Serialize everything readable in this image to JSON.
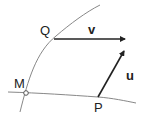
{
  "diagram": {
    "points": {
      "M": {
        "label": "M"
      },
      "Q": {
        "label": "Q"
      },
      "P": {
        "label": "P"
      }
    },
    "vectors": {
      "v": {
        "label": "v",
        "from": "Q"
      },
      "u": {
        "label": "u",
        "from": "P"
      }
    },
    "colors": {
      "curve": "#888888",
      "arrow": "#222222",
      "text": "#222222"
    }
  }
}
